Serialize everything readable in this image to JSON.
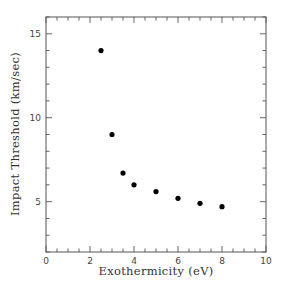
{
  "chart_data": {
    "type": "scatter",
    "title": "",
    "xlabel": "Exothermicity (eV)",
    "ylabel": "Impact Threshold (km/sec)",
    "xlim": [
      0,
      10
    ],
    "ylim": [
      2,
      16
    ],
    "x_ticks": [
      0,
      2,
      4,
      6,
      8,
      10
    ],
    "x_tick_labels": [
      "0",
      "2",
      "4",
      "6",
      "8",
      "10"
    ],
    "x_minor_step": 0.5,
    "y_ticks": [
      5,
      10,
      15
    ],
    "y_tick_labels": [
      "5",
      "10",
      "15"
    ],
    "y_minor_step": 1,
    "grid": false,
    "legend": null,
    "marker": "filled-circle",
    "marker_color": "#000000",
    "series": [
      {
        "name": "Impact threshold",
        "x": [
          2.5,
          3.0,
          3.5,
          4.0,
          5.0,
          6.0,
          7.0,
          8.0
        ],
        "y": [
          14.0,
          9.0,
          6.7,
          6.0,
          5.6,
          5.2,
          4.9,
          4.7
        ]
      }
    ]
  },
  "layout": {
    "plot_left": 46,
    "plot_right": 266,
    "plot_top": 17,
    "plot_bottom": 252
  }
}
